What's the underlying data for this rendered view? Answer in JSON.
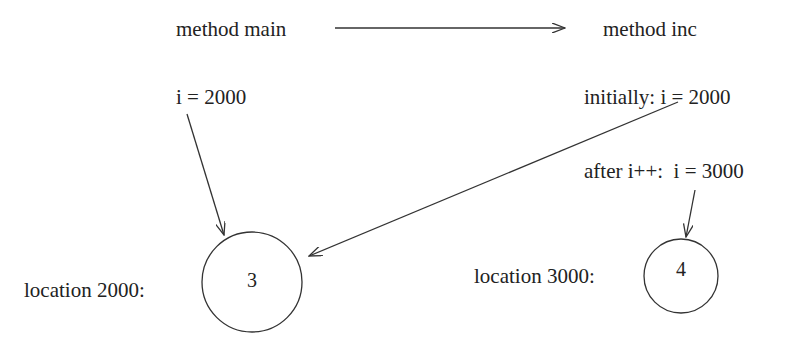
{
  "diagram": {
    "left_method": {
      "title": "method main",
      "variable_label": "i = 2000",
      "location_label": "location 2000:",
      "cell_value": "3"
    },
    "right_method": {
      "title": "method inc",
      "initial_label": "initially: i = 2000",
      "after_label": "after i++:  i = 3000",
      "location_label": "location 3000:",
      "cell_value": "4"
    },
    "arrows": [
      {
        "from": "method main",
        "to": "method inc",
        "meaning": "call"
      },
      {
        "from": "i = 2000 (main)",
        "to": "location 2000"
      },
      {
        "from": "initially: i = 2000 (inc)",
        "to": "location 2000"
      },
      {
        "from": "after i++: i = 3000",
        "to": "location 3000"
      }
    ],
    "colors": {
      "stroke": "#333333",
      "text": "#222222",
      "background": "#ffffff"
    }
  }
}
